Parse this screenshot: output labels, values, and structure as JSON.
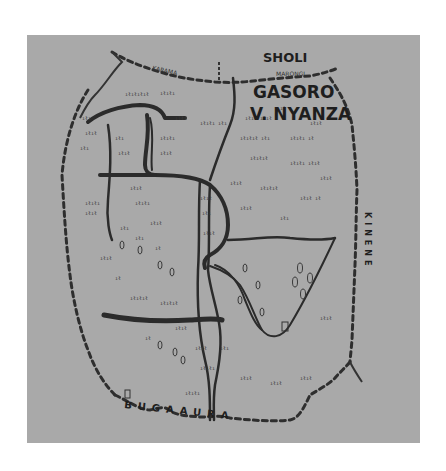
{
  "map": {
    "background_color": "#ffffff",
    "panel_color": "#a9a9a9",
    "ink_color": "#2b2b2b",
    "labels": {
      "north_region": "SHOLI",
      "north_stream": "MARONGI",
      "northwest_stream": "KARAMA",
      "title_line1": "GASORO",
      "title_line2": "V. NYANZA",
      "east_region": "KINENE",
      "south_region": "BUGAAURA"
    },
    "features": {
      "roads": "double-line main roads",
      "borders": "dashed boundary lines",
      "vegetation": "hand-drawn bush/crop marks",
      "trees": "small tree symbols",
      "building": "small rectangle house symbol"
    }
  }
}
